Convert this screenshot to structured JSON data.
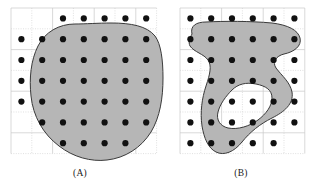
{
  "figure": {
    "type": "diagram",
    "background_color": "#ffffff",
    "dot_color": "#111111",
    "dot_radius": 3.1,
    "region_fill": "#b6b6b6",
    "region_stroke": "#3a3a3a",
    "grid_line_color": "#c9c9c9",
    "grid_dotted_color": "#d2d2d2"
  },
  "panels": [
    {
      "id": "A",
      "caption": "(A)",
      "caption_x": 80,
      "caption_y": 176,
      "grid": {
        "x": 11,
        "y": 8,
        "cell": 20.8,
        "cols": 7,
        "rows": 7,
        "width": 145.6,
        "height": 145.6
      },
      "dots": [
        [
          2,
          0
        ],
        [
          3,
          0
        ],
        [
          4,
          0
        ],
        [
          5,
          0
        ],
        [
          6,
          0
        ],
        [
          0,
          1
        ],
        [
          1,
          1
        ],
        [
          2,
          1
        ],
        [
          3,
          1
        ],
        [
          4,
          1
        ],
        [
          5,
          1
        ],
        [
          6,
          1
        ],
        [
          0,
          2
        ],
        [
          1,
          2
        ],
        [
          2,
          2
        ],
        [
          3,
          2
        ],
        [
          4,
          2
        ],
        [
          5,
          2
        ],
        [
          6,
          2
        ],
        [
          0,
          3
        ],
        [
          1,
          3
        ],
        [
          2,
          3
        ],
        [
          3,
          3
        ],
        [
          4,
          3
        ],
        [
          5,
          3
        ],
        [
          6,
          3
        ],
        [
          0,
          4
        ],
        [
          1,
          4
        ],
        [
          2,
          4
        ],
        [
          3,
          4
        ],
        [
          4,
          4
        ],
        [
          5,
          4
        ],
        [
          6,
          4
        ],
        [
          1,
          5
        ],
        [
          2,
          5
        ],
        [
          3,
          5
        ],
        [
          4,
          5
        ],
        [
          5,
          5
        ],
        [
          6,
          5
        ],
        [
          2,
          6
        ],
        [
          3,
          6
        ],
        [
          4,
          6
        ],
        [
          5,
          6
        ]
      ],
      "shapes": [
        {
          "name": "blob-outline",
          "path": "M 64 16 C 48 16 34 24 27 38 C 20 52 18 70 20 88 C 22 108 32 126 48 138 C 62 149 80 154 96 152 C 114 150 130 140 140 124 C 149 109 152 90 152 70 C 152 52 150 36 144 28 C 136 18 120 15 100 15 C 88 15 74 16 64 16 Z"
        }
      ]
    },
    {
      "id": "B",
      "caption": "(B)",
      "caption_x": 241,
      "caption_y": 176,
      "grid": {
        "x": 180,
        "y": 8,
        "cell": 20.8,
        "cols": 6,
        "rows": 7,
        "width": 124.8,
        "height": 145.6
      },
      "dots": [
        [
          0,
          0
        ],
        [
          1,
          0
        ],
        [
          2,
          0
        ],
        [
          3,
          0
        ],
        [
          4,
          0
        ],
        [
          5,
          0
        ],
        [
          0,
          1
        ],
        [
          1,
          1
        ],
        [
          2,
          1
        ],
        [
          3,
          1
        ],
        [
          4,
          1
        ],
        [
          5,
          1
        ],
        [
          0,
          2
        ],
        [
          1,
          2
        ],
        [
          2,
          2
        ],
        [
          3,
          2
        ],
        [
          4,
          2
        ],
        [
          5,
          2
        ],
        [
          0,
          3
        ],
        [
          1,
          3
        ],
        [
          2,
          3
        ],
        [
          3,
          3
        ],
        [
          4,
          3
        ],
        [
          5,
          3
        ],
        [
          0,
          4
        ],
        [
          1,
          4
        ],
        [
          2,
          4
        ],
        [
          3,
          4
        ],
        [
          4,
          4
        ],
        [
          5,
          4
        ],
        [
          0,
          5
        ],
        [
          1,
          5
        ],
        [
          2,
          5
        ],
        [
          3,
          5
        ],
        [
          4,
          5
        ],
        [
          5,
          5
        ],
        [
          0,
          6
        ],
        [
          1,
          6
        ],
        [
          2,
          6
        ],
        [
          3,
          6
        ],
        [
          4,
          6
        ]
      ],
      "shapes": [
        {
          "name": "blob-outline-with-notches",
          "path": "M 12 26 C 10 18 16 14 26 14 C 44 13 70 13 92 15 C 108 17 118 22 120 30 C 122 38 114 44 104 46 C 96 48 92 54 96 60 C 102 68 110 74 112 84 C 114 96 104 104 92 110 C 80 116 70 124 62 134 C 54 144 44 148 36 144 C 28 140 24 130 22 118 C 20 104 22 90 26 78 C 30 66 32 58 28 52 C 24 46 14 44 10 38 C 8 34 10 30 12 26 Z"
        },
        {
          "name": "blob-hole",
          "path": "M 52 82 C 46 88 40 96 38 104 C 36 112 40 118 48 120 C 58 122 70 118 78 112 C 86 106 92 98 92 90 C 92 82 86 78 76 76 C 66 74 58 76 52 82 Z"
        }
      ]
    }
  ]
}
